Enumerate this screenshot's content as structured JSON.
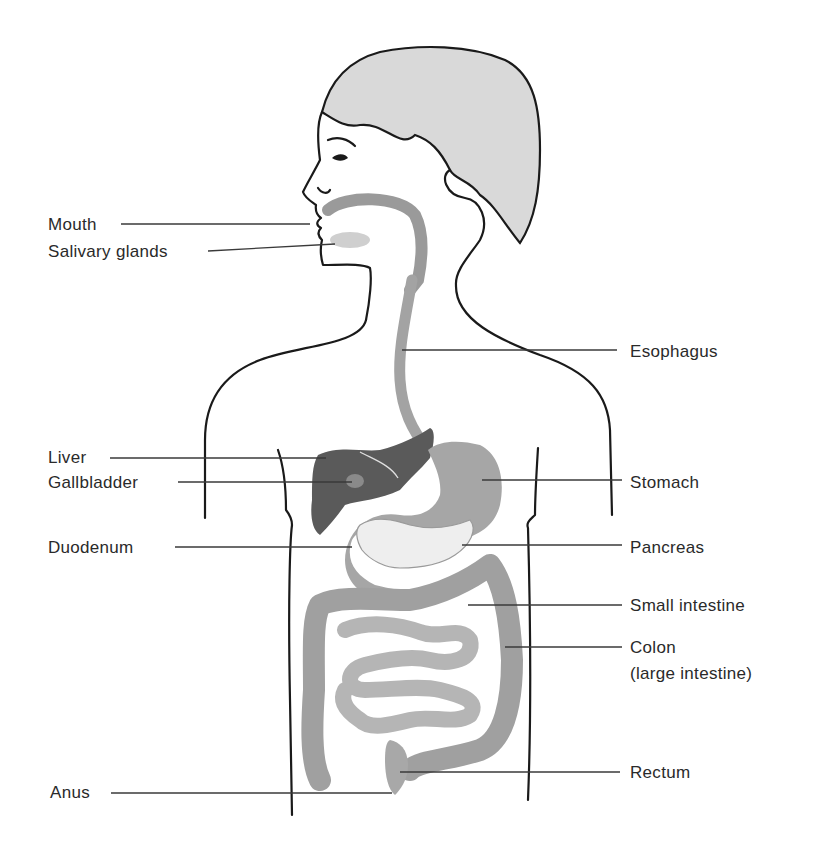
{
  "diagram": {
    "labels_left": [
      {
        "id": "mouth",
        "text": "Mouth"
      },
      {
        "id": "salivary",
        "text": "Salivary glands"
      },
      {
        "id": "liver",
        "text": "Liver"
      },
      {
        "id": "gallbladder",
        "text": "Gallbladder"
      },
      {
        "id": "duodenum",
        "text": "Duodenum"
      },
      {
        "id": "anus",
        "text": "Anus"
      }
    ],
    "labels_right": [
      {
        "id": "esophagus",
        "text": "Esophagus"
      },
      {
        "id": "stomach",
        "text": "Stomach"
      },
      {
        "id": "pancreas",
        "text": "Pancreas"
      },
      {
        "id": "small_intestine",
        "text": "Small intestine"
      },
      {
        "id": "colon",
        "text": "Colon"
      },
      {
        "id": "colon_sub",
        "text": "(large intestine)"
      },
      {
        "id": "rectum",
        "text": "Rectum"
      }
    ],
    "colors": {
      "outline": "#1a1a1a",
      "hair": "#d9d9d9",
      "liver": "#5a5a5a",
      "esophagus": "#9a9a9a",
      "stomach": "#a6a6a6",
      "pancreas": "#efefef",
      "intestine": "#b5b5b5",
      "colon": "#a0a0a0"
    }
  }
}
